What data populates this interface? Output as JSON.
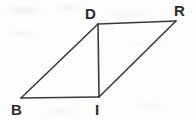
{
  "figure": {
    "name": "parallelogram-bird-with-diagonal",
    "background_color": "#fdfdfd",
    "stroke_color": "#3a3a3a",
    "label_color": "#2b2b2b",
    "stroke_width": 1.6,
    "canvas": {
      "width": 196,
      "height": 122
    }
  },
  "vertices": [
    {
      "id": "D",
      "label": "D",
      "x": 98,
      "y": 24,
      "label_x": 85,
      "label_y": 6
    },
    {
      "id": "R",
      "label": "R",
      "x": 176,
      "y": 21,
      "label_x": 174,
      "label_y": 3
    },
    {
      "id": "I",
      "label": "I",
      "x": 99,
      "y": 97,
      "label_x": 95,
      "label_y": 102
    },
    {
      "id": "B",
      "label": "B",
      "x": 21,
      "y": 98,
      "label_x": 11,
      "label_y": 102
    }
  ],
  "edges": [
    {
      "id": "B-D",
      "from": "B",
      "to": "D",
      "kind": "side",
      "points": "21,98 98,24"
    },
    {
      "id": "D-R",
      "from": "D",
      "to": "R",
      "kind": "side",
      "points": "98,24 176,21"
    },
    {
      "id": "R-I",
      "from": "R",
      "to": "I",
      "kind": "side",
      "points": "176,21 99,97"
    },
    {
      "id": "I-B",
      "from": "I",
      "to": "B",
      "kind": "side",
      "points": "99,97 21,98"
    },
    {
      "id": "D-I",
      "from": "D",
      "to": "I",
      "kind": "diagonal",
      "points": "98,24 99,97"
    }
  ],
  "chart_data": {
    "type": "diagram",
    "title": "",
    "shape": "parallelogram",
    "vertex_order": [
      "B",
      "I",
      "R",
      "D"
    ],
    "diagonals_drawn": [
      "D-I"
    ],
    "labels": [
      "D",
      "R",
      "B",
      "I"
    ],
    "xlabel": "",
    "ylabel": ""
  }
}
